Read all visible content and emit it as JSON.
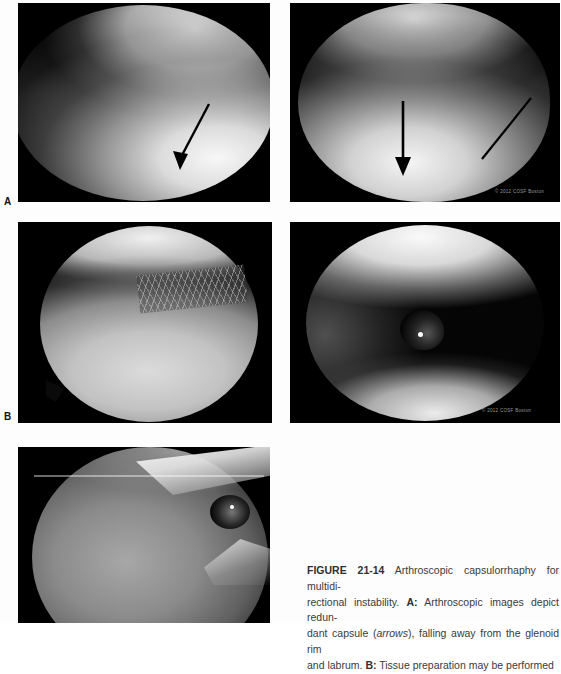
{
  "figure": {
    "number": "FIGURE 21-14",
    "panels": [
      {
        "id": "a-left",
        "label": "A",
        "description": "Arthroscopic view of redundant glenohumeral capsule with black arrow pointing inferiorly toward the capsule falling away from the glenoid rim",
        "annotations": [
          "arrow-diagonal-down-right"
        ],
        "copyright": ""
      },
      {
        "id": "a-right",
        "label": "",
        "description": "Arthroscopic view of redundant capsule with vertical arrow and diagonal pointer line indicating capsular redundancy",
        "annotations": [
          "arrow-down",
          "pointer-line"
        ],
        "copyright": "© 2012 COSF Boston"
      },
      {
        "id": "b-left",
        "label": "B",
        "description": "Arthroscopic view showing tissue preparation of the capsule with a rasp/shaver creating a roughened textured surface",
        "annotations": [],
        "copyright": ""
      },
      {
        "id": "b-right",
        "label": "",
        "description": "Arthroscopic view of instrument tip against the glenoid during tissue preparation",
        "annotations": [],
        "copyright": "© 2012 COSF Boston"
      },
      {
        "id": "c",
        "label": "",
        "description": "Arthroscopic view of the prepared capsule and labrum with instrument entering the joint",
        "annotations": [],
        "copyright": ""
      }
    ]
  },
  "caption": {
    "figure_number": "FIGURE 21-14",
    "lines": [
      {
        "segments": [
          {
            "text": "FIGURE 21-14",
            "style": "fig-num"
          },
          {
            "text": " Arthroscopic capsulorrhaphy for multidi-",
            "style": "normal"
          }
        ]
      },
      {
        "segments": [
          {
            "text": "rectional instability. ",
            "style": "normal"
          },
          {
            "text": "A:",
            "style": "bold"
          },
          {
            "text": " Arthroscopic images depict redun-",
            "style": "normal"
          }
        ]
      },
      {
        "segments": [
          {
            "text": "dant capsule (",
            "style": "normal"
          },
          {
            "text": "arrows",
            "style": "ital"
          },
          {
            "text": "), falling away from the glenoid rim",
            "style": "normal"
          }
        ]
      },
      {
        "segments": [
          {
            "text": "and labrum. ",
            "style": "normal"
          },
          {
            "text": "B:",
            "style": "bold"
          },
          {
            "text": " Tissue preparation may be performed",
            "style": "normal"
          }
        ]
      }
    ],
    "full_text": "FIGURE 21-14 Arthroscopic capsulorrhaphy for multidirectional instability. A: Arthroscopic images depict redundant capsule (arrows), falling away from the glenoid rim and labrum. B: Tissue preparation may be performed"
  },
  "labels": {
    "panel_a": "A",
    "panel_b": "B"
  },
  "copyright_text": "© 2012 COSF Boston",
  "colors": {
    "page_background": "#fdfdfd",
    "panel_background": "#000000",
    "caption_text": "#3a3a3a",
    "label_text": "#111111",
    "copyright_text": "#9a9a9a"
  }
}
